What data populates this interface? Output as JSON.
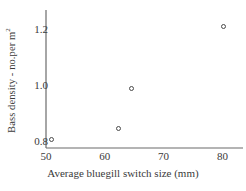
{
  "chart_data": {
    "type": "scatter",
    "title": "",
    "xlabel": "Average bluegill switch size (mm)",
    "ylabel": "Bass density - no.per m",
    "ylabel_superscript": "2",
    "xlim": [
      50,
      83.5
    ],
    "ylim": [
      0.78,
      1.27
    ],
    "xticks": [
      50,
      60,
      70,
      80
    ],
    "xtick_labels": [
      "50",
      "60",
      "70",
      "80"
    ],
    "yticks": [
      0.8,
      1.0,
      1.2
    ],
    "ytick_labels": [
      "0.8",
      "1.0",
      "1.2"
    ],
    "grid": false,
    "legend": false,
    "marker_style": "open-circle",
    "marker_color": "#4a4a4a",
    "axis_color": "#6b6b6b",
    "points": [
      {
        "x": 51.0,
        "y": 0.81
      },
      {
        "x": 62.4,
        "y": 0.85
      },
      {
        "x": 64.6,
        "y": 0.99
      },
      {
        "x": 80.2,
        "y": 1.21
      }
    ]
  }
}
